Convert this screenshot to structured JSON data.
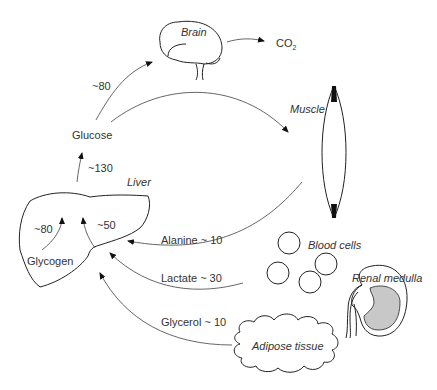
{
  "diagram": {
    "title": "",
    "organs": {
      "brain": "Brain",
      "muscle": "Muscle",
      "liver": "Liver",
      "blood_cells": "Blood cells",
      "renal_medulla": "Renal medulla",
      "adipose_tissue": "Adipose tissue"
    },
    "nodes": {
      "glucose": "Glucose",
      "glycogen": "Glycogen",
      "co2_main": "CO",
      "co2_sub": "2"
    },
    "flows": {
      "glucose_to_brain": "~80",
      "liver_to_glucose": "~130",
      "glycogen_breakdown": "~80",
      "gluconeogenesis": "~50",
      "alanine": "Alanine ~ 10",
      "lactate": "Lactate ~ 30",
      "glycerol": "Glycerol ~ 10"
    },
    "colors": {
      "line": "#222222",
      "flow_line": "#555555",
      "medulla_fill": "#c8c8c8",
      "text": "#333333"
    }
  }
}
